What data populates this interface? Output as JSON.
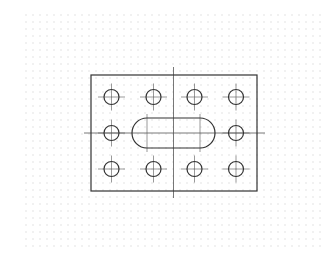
{
  "drawing": {
    "title": "Plate with hole pattern and slot",
    "grid": {
      "x0": 26,
      "y0": 15,
      "x1": 325,
      "y1": 250,
      "spacing": 7,
      "color": "#c8c8c8"
    },
    "stroke_color": "#333333",
    "centerline_color": "#555555",
    "plate": {
      "x": 91,
      "y": 75,
      "width": 166,
      "height": 116
    },
    "holes": {
      "radius": 7.5,
      "columns": [
        111.5,
        153.5,
        194.5,
        236
      ],
      "rows": [
        97,
        133,
        169
      ],
      "skip": [
        [
          1,
          1
        ],
        [
          1,
          2
        ]
      ]
    },
    "slot": {
      "x": 132,
      "y": 118,
      "width": 83,
      "height": 30
    },
    "centerlines": {
      "vertical": {
        "x": 173.5,
        "y1": 67,
        "y2": 198
      },
      "horizontal": {
        "y": 133,
        "x1": 84,
        "x2": 265
      }
    }
  }
}
